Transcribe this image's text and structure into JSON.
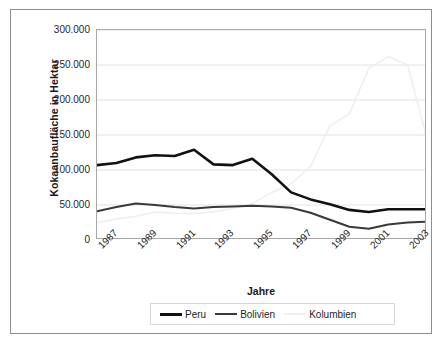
{
  "chart_data": {
    "type": "line",
    "title": "",
    "xlabel": "Jahre",
    "ylabel": "Kokaanbaufläche in Hektar",
    "x": [
      1987,
      1988,
      1989,
      1990,
      1991,
      1992,
      1993,
      1994,
      1995,
      1996,
      1997,
      1998,
      1999,
      2000,
      2001,
      2002,
      2003,
      2004
    ],
    "x_tick_labels": [
      "1987",
      "1989",
      "1991",
      "1993",
      "1995",
      "1997",
      "1999",
      "2001",
      "2003"
    ],
    "x_tick_values": [
      1987,
      1989,
      1991,
      1993,
      1995,
      1997,
      1999,
      2001,
      2003
    ],
    "y_tick_labels": [
      "300.000",
      "250.000",
      "200.000",
      "150.000",
      "100.000",
      "50.000",
      "0"
    ],
    "y_tick_values": [
      300000,
      250000,
      200000,
      150000,
      100000,
      50000,
      0
    ],
    "ylim": [
      0,
      300000
    ],
    "xlim": [
      1987,
      2004
    ],
    "grid": "horizontal",
    "legend_position": "bottom",
    "series": [
      {
        "name": "Peru",
        "color": "#111111",
        "width": 2.6,
        "values": [
          107000,
          110000,
          118000,
          121000,
          120000,
          129000,
          108000,
          107000,
          116000,
          94000,
          68000,
          58000,
          51000,
          43000,
          40000,
          44000,
          44000,
          44000
        ]
      },
      {
        "name": "Bolivien",
        "color": "#3a3a3a",
        "width": 2.0,
        "values": [
          41000,
          47000,
          52000,
          50000,
          47000,
          45000,
          47000,
          48000,
          49000,
          48000,
          46000,
          39000,
          29000,
          19000,
          16000,
          22000,
          25000,
          26000
        ]
      },
      {
        "name": "Kolumbien",
        "color": "#efefef",
        "width": 1.6,
        "values": [
          25000,
          30000,
          34000,
          40000,
          38000,
          38000,
          40000,
          45000,
          52000,
          68000,
          80000,
          105000,
          163000,
          180000,
          245000,
          262000,
          250000,
          145000
        ]
      }
    ]
  },
  "legend": {
    "items": [
      {
        "label": "Peru",
        "marker": "line-thick-black"
      },
      {
        "label": "Bolivien",
        "marker": "line-medium-gray"
      },
      {
        "label": "Kolumbien",
        "marker": "line-thin-light"
      }
    ]
  },
  "colors": {
    "peru": "#111111",
    "bolivien": "#3a3a3a",
    "kolumbien": "#efefef",
    "grid": "#e2e2e2",
    "frame": "#8d8d8d",
    "plot_border": "#a8a8a8",
    "text": "#1f1f1f"
  }
}
